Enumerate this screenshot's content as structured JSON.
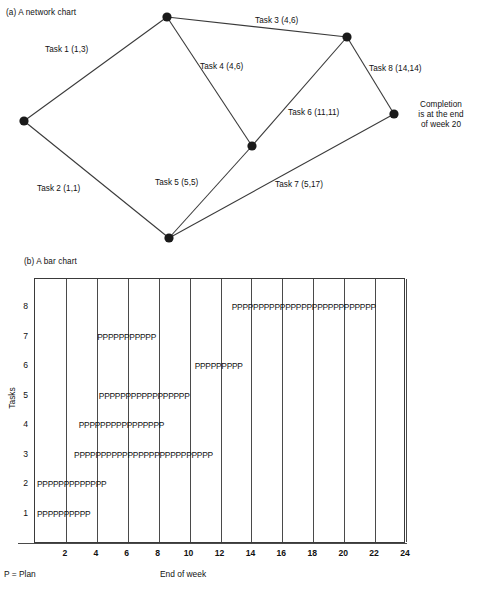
{
  "figure": {
    "panel_a_caption": "(a) A network chart",
    "panel_b_caption": "(b) A bar chart"
  },
  "network": {
    "nodes": [
      {
        "id": "n1",
        "name": "node-start",
        "x": 24,
        "y": 121
      },
      {
        "id": "n2",
        "name": "node-top",
        "x": 167,
        "y": 17
      },
      {
        "id": "n3",
        "name": "node-top-right",
        "x": 347,
        "y": 37
      },
      {
        "id": "n4",
        "name": "node-middle",
        "x": 252,
        "y": 146
      },
      {
        "id": "n5",
        "name": "node-bottom",
        "x": 169,
        "y": 238
      },
      {
        "id": "n6",
        "name": "node-completion",
        "x": 394,
        "y": 114
      }
    ],
    "edges": [
      {
        "from": "n1",
        "to": "n2",
        "label": "Task 1 (1,3)",
        "label_x": 45,
        "label_y": 45,
        "task": 1,
        "duration": 1,
        "float": 3
      },
      {
        "from": "n1",
        "to": "n5",
        "label": "Task 2 (1,1)",
        "label_x": 37,
        "label_y": 184,
        "task": 2,
        "duration": 1,
        "float": 1
      },
      {
        "from": "n2",
        "to": "n3",
        "label": "Task 3 (4,6)",
        "label_x": 255,
        "label_y": 16,
        "task": 3,
        "duration": 4,
        "float": 6
      },
      {
        "from": "n2",
        "to": "n4",
        "label": "Task 4 (4,6)",
        "label_x": 200,
        "label_y": 62,
        "task": 4,
        "duration": 4,
        "float": 6
      },
      {
        "from": "n5",
        "to": "n4",
        "label": "Task 5 (5,5)",
        "label_x": 155,
        "label_y": 178,
        "task": 5,
        "duration": 5,
        "float": 5
      },
      {
        "from": "n4",
        "to": "n3",
        "label": "Task 6 (11,11)",
        "label_x": 288,
        "label_y": 108,
        "task": 6,
        "duration": 11,
        "float": 11
      },
      {
        "from": "n5",
        "to": "n6",
        "label": "Task 7 (5,17)",
        "label_x": 275,
        "label_y": 180,
        "task": 7,
        "duration": 5,
        "float": 17
      },
      {
        "from": "n3",
        "to": "n6",
        "label": "Task 8 (14,14)",
        "label_x": 369,
        "label_y": 64,
        "task": 8,
        "duration": 14,
        "float": 14
      }
    ],
    "completion_note": "Completion is at the end of week 20",
    "completion_note_lines": [
      "Completion",
      "is at the end",
      "of week 20"
    ],
    "completion_note_x": 408,
    "completion_note_y": 100
  },
  "barchart": {
    "ylabel": "Tasks",
    "xlabel": "End of week",
    "legend_note": "P = Plan",
    "ytick_labels": [
      "1",
      "2",
      "3",
      "4",
      "5",
      "6",
      "7",
      "8"
    ],
    "xtick_labels": [
      "2",
      "4",
      "6",
      "8",
      "10",
      "12",
      "14",
      "16",
      "18",
      "20",
      "22",
      "24"
    ]
  },
  "chart_data": {
    "type": "bar",
    "title": "(b) A bar chart",
    "xlabel": "End of week",
    "ylabel": "Tasks",
    "xlim": [
      0,
      24
    ],
    "ylim": [
      0,
      9
    ],
    "grid": true,
    "legend": "P = Plan",
    "orientation": "horizontal",
    "bar_marker": "P",
    "categories": [
      "1",
      "2",
      "3",
      "4",
      "5",
      "6",
      "7",
      "8"
    ],
    "bars": [
      {
        "task": "1",
        "start": 0.0,
        "end": 1.6,
        "marker_text": "PPPPPPPPPP"
      },
      {
        "task": "2",
        "start": 0.0,
        "end": 2.4,
        "marker_text": "PPPPPPPPPPPPP"
      },
      {
        "task": "3",
        "start": 2.4,
        "end": 10.6,
        "marker_text": "PPPPPPPPPPPPPPPPPPPPPPPPPP"
      },
      {
        "task": "4",
        "start": 2.7,
        "end": 7.8,
        "marker_text": "PPPPPPPPPPPPPPPP"
      },
      {
        "task": "5",
        "start": 4.0,
        "end": 9.5,
        "marker_text": "PPPPPPPPPPPPPPPPP"
      },
      {
        "task": "6",
        "start": 10.2,
        "end": 13.2,
        "marker_text": "PPPPPPPPP"
      },
      {
        "task": "7",
        "start": 3.9,
        "end": 7.6,
        "marker_text": "PPPPPPPPPPP"
      },
      {
        "task": "8",
        "start": 12.6,
        "end": 21.0,
        "marker_text": "PPPPPPPPPPPPPPPPPPPPPPPPPPP"
      }
    ],
    "xticks": [
      2,
      4,
      6,
      8,
      10,
      12,
      14,
      16,
      18,
      20,
      22,
      24
    ],
    "yticks": [
      1,
      2,
      3,
      4,
      5,
      6,
      7,
      8
    ]
  },
  "style": {
    "node_color": "#1a1a1a",
    "line_color": "#3a3a3a",
    "text_color": "#111111"
  }
}
